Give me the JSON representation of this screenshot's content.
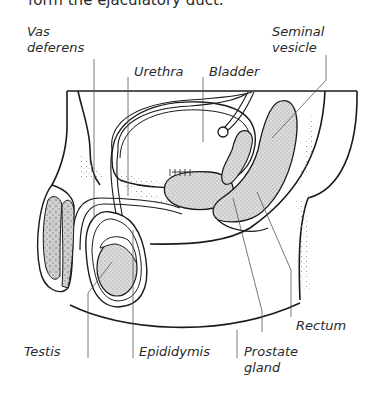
{
  "caption": "form the ejaculatory duct.",
  "diagram": {
    "colors": {
      "outline": "#1a1a1a",
      "leader": "#555555",
      "shaded_tissue": "#dcdcdc",
      "stipple": "#8a8a8a",
      "background": "#ffffff"
    },
    "labels": [
      {
        "id": "vas-deferens",
        "line1": "Vas",
        "line2": "deferens"
      },
      {
        "id": "urethra",
        "line1": "Urethra"
      },
      {
        "id": "bladder",
        "line1": "Bladder"
      },
      {
        "id": "seminal-vesicle",
        "line1": "Seminal",
        "line2": "vesicle"
      },
      {
        "id": "rectum",
        "line1": "Rectum"
      },
      {
        "id": "testis",
        "line1": "Testis"
      },
      {
        "id": "epididymis",
        "line1": "Epididymis"
      },
      {
        "id": "prostate-gland",
        "line1": "Prostate",
        "line2": "gland"
      }
    ]
  }
}
